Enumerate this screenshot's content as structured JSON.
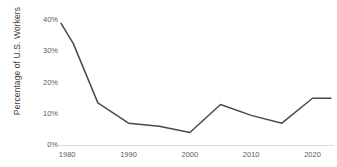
{
  "chart_data": {
    "type": "line",
    "title": "",
    "xlabel": "",
    "ylabel": "Percentage of U.S. Workers",
    "xlim": [
      1978.5,
      2023.5
    ],
    "ylim": [
      0,
      42
    ],
    "grid": false,
    "legend": null,
    "line_color": "#4a4a4a",
    "axis_color": "#d9d9d9",
    "tick_text_color": "#5a5a5a",
    "y_ticks": [
      {
        "value": 0,
        "label": "0%"
      },
      {
        "value": 10,
        "label": "10%"
      },
      {
        "value": 20,
        "label": "20%"
      },
      {
        "value": 30,
        "label": "30%"
      },
      {
        "value": 40,
        "label": "40%"
      }
    ],
    "x_ticks": [
      {
        "value": 1980,
        "label": "1980"
      },
      {
        "value": 1990,
        "label": "1990"
      },
      {
        "value": 2000,
        "label": "2000"
      },
      {
        "value": 2010,
        "label": "2010"
      },
      {
        "value": 2020,
        "label": "2020"
      }
    ],
    "series": [
      {
        "name": "Percentage of U.S. Workers",
        "x": [
          1979,
          1981,
          1985,
          1990,
          1995,
          2000,
          2005,
          2010,
          2015,
          2020,
          2023
        ],
        "values": [
          39,
          32.5,
          13.5,
          7,
          6,
          4,
          13,
          9.5,
          7,
          15,
          15
        ]
      }
    ]
  }
}
